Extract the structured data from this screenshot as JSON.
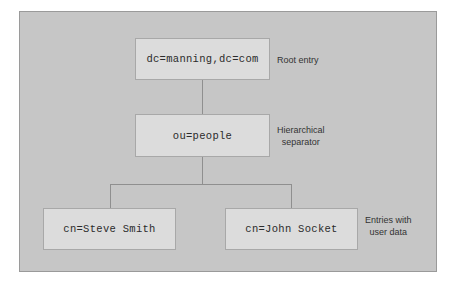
{
  "diagram": {
    "colors": {
      "plate": "#c6c6c6",
      "plate_border": "#9a9a9a",
      "node_fill": "#dcdcdc",
      "node_border": "#a8a8a8",
      "wire": "#8f8f8f",
      "text": "#2b2b2b",
      "annotation_text": "#333333"
    },
    "nodes": {
      "root": "dc=manning,dc=com",
      "ou": "ou=people",
      "leaf_left": "cn=Steve Smith",
      "leaf_right": "cn=John Socket"
    },
    "annotations": {
      "root": "Root entry",
      "ou": "Hierarchical\nseparator",
      "leaves": "Entries with\nuser data"
    }
  }
}
